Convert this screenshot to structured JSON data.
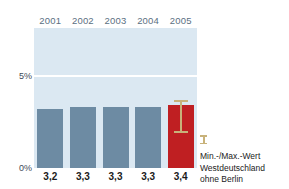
{
  "chart_data": {
    "type": "bar",
    "title": "",
    "xlabel": "",
    "ylabel": "",
    "categories": [
      "2001",
      "2002",
      "2003",
      "2004",
      "2005"
    ],
    "values": [
      3.2,
      3.3,
      3.3,
      3.3,
      3.4
    ],
    "value_labels": [
      "3,2",
      "3,3",
      "3,3",
      "3,3",
      "3,4"
    ],
    "ylim": [
      0,
      7.6
    ],
    "ytick_values": [
      0,
      5
    ],
    "ytick_labels": [
      "0%",
      "5%"
    ],
    "grid": true,
    "gridlines_at": [
      5
    ],
    "legend_position": "right",
    "series": [
      {
        "name": "Jahreswert",
        "values": [
          3.2,
          3.3,
          3.3,
          3.3,
          3.4
        ],
        "colors": [
          "#6d8ba3",
          "#6d8ba3",
          "#6d8ba3",
          "#6d8ba3",
          "#bf1f22"
        ]
      }
    ],
    "error_bar": {
      "category": "2005",
      "max": 3.7,
      "min": 1.9,
      "color": "#c8b27a"
    },
    "legend": [
      {
        "marker": "error-bar-icon",
        "color": "#c8b27a",
        "lines": [
          "Min.-/Max.-Wert",
          "Westdeutschland",
          "ohne Berlin"
        ]
      }
    ],
    "colors": {
      "plot_background": "#dbe8f2",
      "bar_default": "#6d8ba3",
      "bar_highlight": "#bf1f22",
      "gridline": "#ffffff",
      "year_label": "#5b6f82",
      "value_label": "#1b1b1b",
      "error_bar": "#c8b27a",
      "page_background": "#ffffff"
    }
  }
}
